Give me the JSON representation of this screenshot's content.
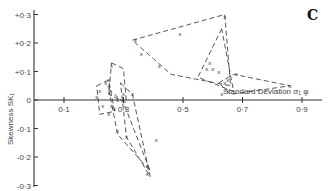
{
  "chart_data": {
    "type": "scatter",
    "title": "",
    "panel_label": "C",
    "xlabel": "Standard Deviation σ₁ φ",
    "ylabel": "Skewness SK₁",
    "xlim": [
      0.0,
      0.95
    ],
    "ylim": [
      -0.3,
      0.3
    ],
    "x_ticks": [
      "0·1",
      "0·3",
      "0·5",
      "0·7",
      "0·9"
    ],
    "x_tick_values": [
      0.1,
      0.3,
      0.5,
      0.7,
      0.9
    ],
    "y_ticks": [
      "+0·3",
      "+0·2",
      "+0·1",
      "0",
      "-0·1",
      "-0·2",
      "-0·3"
    ],
    "y_tick_values": [
      0.3,
      0.2,
      0.1,
      0.0,
      -0.1,
      -0.2,
      -0.3
    ],
    "grid": false,
    "marker": "x",
    "points": [
      {
        "x": 0.34,
        "y": 0.21
      },
      {
        "x": 0.36,
        "y": 0.16
      },
      {
        "x": 0.42,
        "y": 0.12
      },
      {
        "x": 0.49,
        "y": 0.23
      },
      {
        "x": 0.64,
        "y": 0.29
      },
      {
        "x": 0.59,
        "y": 0.13
      },
      {
        "x": 0.58,
        "y": 0.11
      },
      {
        "x": 0.6,
        "y": 0.11
      },
      {
        "x": 0.62,
        "y": 0.1
      },
      {
        "x": 0.64,
        "y": 0.06
      },
      {
        "x": 0.65,
        "y": 0.07
      },
      {
        "x": 0.68,
        "y": 0.09
      },
      {
        "x": 0.86,
        "y": 0.05
      },
      {
        "x": 0.63,
        "y": 0.02
      },
      {
        "x": 0.26,
        "y": 0.12
      },
      {
        "x": 0.25,
        "y": 0.07
      },
      {
        "x": 0.24,
        "y": 0.06
      },
      {
        "x": 0.25,
        "y": 0.05
      },
      {
        "x": 0.22,
        "y": 0.03
      },
      {
        "x": 0.21,
        "y": 0.01
      },
      {
        "x": 0.23,
        "y": -0.02
      },
      {
        "x": 0.26,
        "y": -0.02
      },
      {
        "x": 0.27,
        "y": -0.03
      },
      {
        "x": 0.25,
        "y": -0.05
      },
      {
        "x": 0.28,
        "y": 0.0
      },
      {
        "x": 0.3,
        "y": 0.02
      },
      {
        "x": 0.28,
        "y": -0.11
      },
      {
        "x": 0.31,
        "y": -0.13
      },
      {
        "x": 0.41,
        "y": -0.14
      },
      {
        "x": 0.38,
        "y": -0.23
      },
      {
        "x": 0.38,
        "y": -0.26
      },
      {
        "x": 0.33,
        "y": 0.02
      }
    ],
    "envelopes": [
      {
        "name": "upper-large",
        "vertices": [
          [
            0.33,
            0.21
          ],
          [
            0.64,
            0.3
          ],
          [
            0.66,
            0.05
          ],
          [
            0.46,
            0.09
          ]
        ]
      },
      {
        "name": "upper-triangle",
        "vertices": [
          [
            0.63,
            0.25
          ],
          [
            0.55,
            0.08
          ],
          [
            0.67,
            0.03
          ]
        ]
      },
      {
        "name": "right-elongated",
        "vertices": [
          [
            0.62,
            0.06
          ],
          [
            0.67,
            0.09
          ],
          [
            0.86,
            0.05
          ],
          [
            0.66,
            0.02
          ]
        ]
      },
      {
        "name": "cluster-small-1",
        "vertices": [
          [
            0.21,
            0.05
          ],
          [
            0.25,
            0.07
          ],
          [
            0.27,
            -0.04
          ],
          [
            0.22,
            -0.05
          ]
        ]
      },
      {
        "name": "cluster-small-2",
        "vertices": [
          [
            0.26,
            0.13
          ],
          [
            0.3,
            0.11
          ],
          [
            0.31,
            -0.01
          ],
          [
            0.25,
            0.02
          ]
        ]
      },
      {
        "name": "lower-long",
        "vertices": [
          [
            0.25,
            0.04
          ],
          [
            0.3,
            -0.01
          ],
          [
            0.39,
            -0.25
          ],
          [
            0.28,
            -0.12
          ]
        ]
      },
      {
        "name": "lower-wide",
        "vertices": [
          [
            0.29,
            0.06
          ],
          [
            0.33,
            0.02
          ],
          [
            0.39,
            -0.27
          ],
          [
            0.31,
            -0.13
          ]
        ]
      }
    ]
  }
}
